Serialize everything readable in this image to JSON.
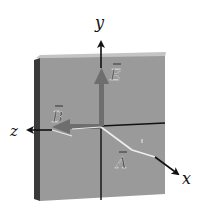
{
  "figure": {
    "type": "em-wave-plate-diagram",
    "axes": [
      {
        "name": "y",
        "label": "y"
      },
      {
        "name": "z",
        "label": "z"
      },
      {
        "name": "x",
        "label": "x"
      }
    ],
    "vectors": [
      {
        "name": "E",
        "label": "E",
        "direction": "+y"
      },
      {
        "name": "B",
        "label": "B",
        "direction": "+z"
      },
      {
        "name": "A",
        "label": "A",
        "direction": "toward +x"
      }
    ],
    "colors": {
      "plate_face": "#9a9a9a",
      "plate_edge_dark": "#3a3a3a",
      "plate_top": "#c4c4c4",
      "field_vector": "#6e6e6e",
      "axis": "#111111",
      "background": "#ffffff"
    }
  }
}
